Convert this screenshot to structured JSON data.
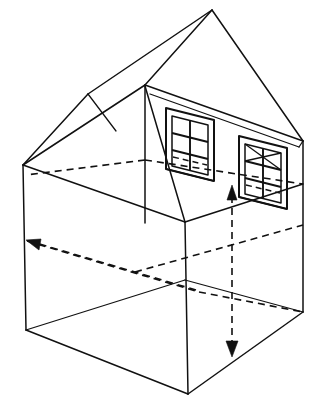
{
  "figure": {
    "title": "Isometric cutaway drawing of a house",
    "background_color": "#ffffff",
    "line_color": "#111111",
    "line_style_solid": "solid",
    "line_style_hidden": "dashed"
  },
  "geometry": {
    "roof": {
      "name": "gable-roof",
      "apex": {
        "x": 212,
        "y": 10
      },
      "ridge_front": {
        "x": 145,
        "y": 85
      },
      "left_eave": {
        "x": 23,
        "y": 165
      },
      "left_eave_upper": {
        "x": 90,
        "y": 95
      },
      "right_eave": {
        "x": 303,
        "y": 141
      },
      "gable_left": {
        "x": 145,
        "y": 85
      }
    },
    "walls": {
      "back_left_top": {
        "x": 23,
        "y": 165
      },
      "back_center_top": {
        "x": 145,
        "y": 85
      },
      "back_right_top": {
        "x": 303,
        "y": 141
      },
      "interior_corner_top": {
        "x": 185,
        "y": 222
      },
      "front_bottom": {
        "x": 188,
        "y": 394
      },
      "left_bottom": {
        "x": 26,
        "y": 330
      },
      "right_bottom": {
        "x": 303,
        "y": 312
      }
    },
    "floor": {
      "name": "interior-floor-plane",
      "visible_corner": {
        "x": 185,
        "y": 222
      }
    }
  },
  "windows": [
    {
      "id": "window-left",
      "label": "left window",
      "panes": 6,
      "has_diagonal_cross": false,
      "frame": {
        "top_left": {
          "x": 167,
          "y": 110
        },
        "top_right": {
          "x": 212,
          "y": 122
        },
        "bottom_right": {
          "x": 212,
          "y": 180
        },
        "bottom_left": {
          "x": 167,
          "y": 168
        }
      }
    },
    {
      "id": "window-right",
      "label": "right window",
      "panes": 6,
      "has_diagonal_cross": true,
      "frame": {
        "top_left": {
          "x": 240,
          "y": 138
        },
        "top_right": {
          "x": 285,
          "y": 150
        },
        "bottom_right": {
          "x": 285,
          "y": 208
        },
        "bottom_left": {
          "x": 240,
          "y": 196
        }
      }
    }
  ],
  "dimension_arrows": [
    {
      "id": "width-arrow",
      "label": "horizontal width dimension",
      "orientation": "horizontal-isometric",
      "style": "dashed",
      "head_end": "start",
      "start": {
        "x": 27,
        "y": 241
      },
      "end": {
        "x": 195,
        "y": 289
      }
    },
    {
      "id": "height-arrow",
      "label": "vertical height dimension",
      "orientation": "vertical",
      "style": "dashed",
      "head_end": "both",
      "start": {
        "x": 232,
        "y": 190
      },
      "end": {
        "x": 232,
        "y": 352
      }
    }
  ],
  "hidden_lines": [
    {
      "id": "hidden-back-floor-left",
      "from": {
        "x": 23,
        "y": 165
      },
      "to": {
        "x": 145,
        "y": 205
      }
    },
    {
      "id": "hidden-back-wall-base",
      "from": {
        "x": 27,
        "y": 241
      },
      "to": {
        "x": 195,
        "y": 292
      }
    },
    {
      "id": "hidden-floor-diagonal",
      "from": {
        "x": 135,
        "y": 272
      },
      "to": {
        "x": 303,
        "y": 225
      }
    }
  ],
  "scan_artifacts": {
    "top_left": "",
    "bottom": ""
  }
}
